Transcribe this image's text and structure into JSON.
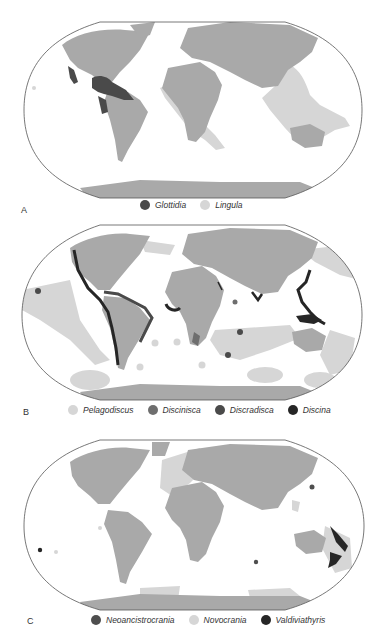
{
  "figure": {
    "panels": [
      {
        "id": "A",
        "letter": "A",
        "legend": [
          {
            "label": "Glottidia",
            "color": "#4a4a4a"
          },
          {
            "label": "Lingula",
            "color": "#d6d6d6"
          }
        ]
      },
      {
        "id": "B",
        "letter": "B",
        "legend": [
          {
            "label": "Pelagodiscus",
            "color": "#d6d6d6"
          },
          {
            "label": "Discinisca",
            "color": "#6e6e6e"
          },
          {
            "label": "Discradisca",
            "color": "#4a4a4a"
          },
          {
            "label": "Discina",
            "color": "#262626"
          }
        ]
      },
      {
        "id": "C",
        "letter": "C",
        "legend": [
          {
            "label": "Neoancistrocrania",
            "color": "#4e4e4e"
          },
          {
            "label": "Novocrania",
            "color": "#d6d6d6"
          },
          {
            "label": "Valdiviathyris",
            "color": "#262626"
          }
        ]
      }
    ],
    "colors": {
      "land": "#a9a9a9",
      "border": "#c8c8c8",
      "outline": "#555555",
      "ocean": "#ffffff"
    }
  }
}
